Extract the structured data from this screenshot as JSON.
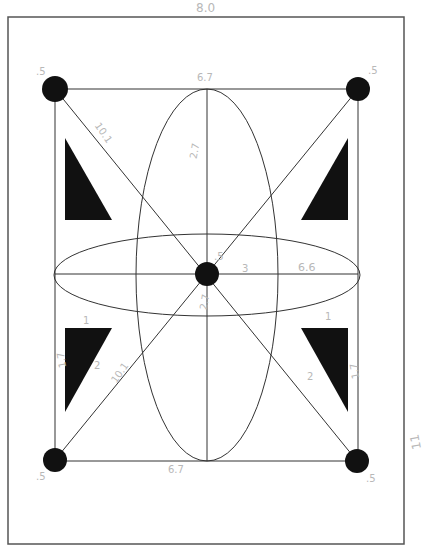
{
  "diagram": {
    "type": "hand-annotated geometric layout diagram",
    "colors": {
      "background": "#ffffff",
      "stroke": "#333333",
      "fill": "#111111",
      "annotation": "#b8b8b8"
    },
    "frame": {
      "x": 8,
      "y": 17,
      "width": 396,
      "height": 527
    },
    "rectangle": {
      "x": 55,
      "y": 89,
      "width": 303,
      "height": 372
    },
    "corner_dots": [
      {
        "name": "top-left",
        "cx": 55,
        "cy": 89,
        "r": 14
      },
      {
        "name": "top-right",
        "cx": 358,
        "cy": 89,
        "r": 12
      },
      {
        "name": "bottom-left",
        "cx": 55,
        "cy": 460,
        "r": 12
      },
      {
        "name": "bottom-right",
        "cx": 357,
        "cy": 461,
        "r": 12
      }
    ],
    "center_dot": {
      "cx": 207,
      "cy": 274,
      "r": 12
    },
    "ellipses": [
      {
        "name": "vertical-ellipse",
        "cx": 207,
        "cy": 275,
        "rx": 71,
        "ry": 186
      },
      {
        "name": "horizontal-ellipse",
        "cx": 207,
        "cy": 275,
        "rx": 153,
        "ry": 41
      }
    ],
    "triangles": [
      {
        "name": "top-left",
        "points": "65,138 65,220 112,220"
      },
      {
        "name": "top-right",
        "points": "348,138 348,220 301,220"
      },
      {
        "name": "bottom-left",
        "points": "65,328 112,328 65,412"
      },
      {
        "name": "bottom-right",
        "points": "301,328 348,328 348,412"
      }
    ],
    "annotations": {
      "frame_top": "8.0",
      "frame_right": "11",
      "dot_top_left": ".5",
      "dot_top_right": ".5",
      "dot_bottom_left": ".5",
      "dot_bottom_right": ".5",
      "rect_top": "6.7",
      "rect_bottom": "6.7",
      "diagonal_upper_left": "10.1",
      "diagonal_lower_left": "10.1",
      "vertical_upper": "2.7",
      "vertical_lower": "2.7",
      "center_dot": ".5",
      "center_to_right": "3",
      "horizontal_right": "6.6",
      "triangle_left_side": "1.7",
      "triangle_left_hyp": "2",
      "triangle_left_top": "1",
      "triangle_right_side": "1.7",
      "triangle_right_hyp": "2",
      "triangle_right_top": "1"
    }
  }
}
